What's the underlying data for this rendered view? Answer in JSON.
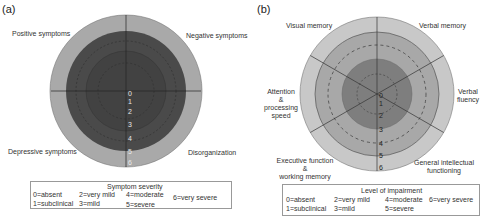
{
  "panel_a": {
    "label": "(a)",
    "axes": [
      "Positive symptoms",
      "Negative symptoms",
      "Depressive symptoms",
      "Disorganization"
    ],
    "ticks": [
      "0",
      "1",
      "2",
      "3",
      "4",
      "5",
      "6"
    ],
    "legend": {
      "title": "Symptom severity",
      "items": [
        "0=absent",
        "1=subclinical",
        "2=very mild",
        "3=mild",
        "4=moderate",
        "5=severe",
        "6=very severe"
      ]
    }
  },
  "panel_b": {
    "label": "(b)",
    "axes": {
      "visual_memory": "Visual memory",
      "verbal_memory": "Verbal memory",
      "verbal_fluency_1": "Verbal",
      "verbal_fluency_2": "fluency",
      "attention_1": "Attention",
      "attention_2": "&",
      "attention_3": "processing",
      "attention_4": "speed",
      "executive_1": "Executive function",
      "executive_2": "&",
      "executive_3": "working memory",
      "general_1": "General intellectual",
      "general_2": "functioning"
    },
    "ticks": [
      "0",
      "1",
      "2",
      "3",
      "4",
      "5",
      "6"
    ],
    "legend": {
      "title": "Level of impairment",
      "items": [
        "0=absent",
        "1=subclinical",
        "2=very mild",
        "3=mild",
        "4=moderate",
        "5=severe",
        "6=very severe"
      ]
    }
  },
  "colors": {
    "a_outer": "#a9a9a9",
    "a_inner": "#4a4a4a",
    "b_outer": "#c8c8c8",
    "b_middle": "#a8a8a8",
    "b_inner": "#7e7e7e"
  }
}
